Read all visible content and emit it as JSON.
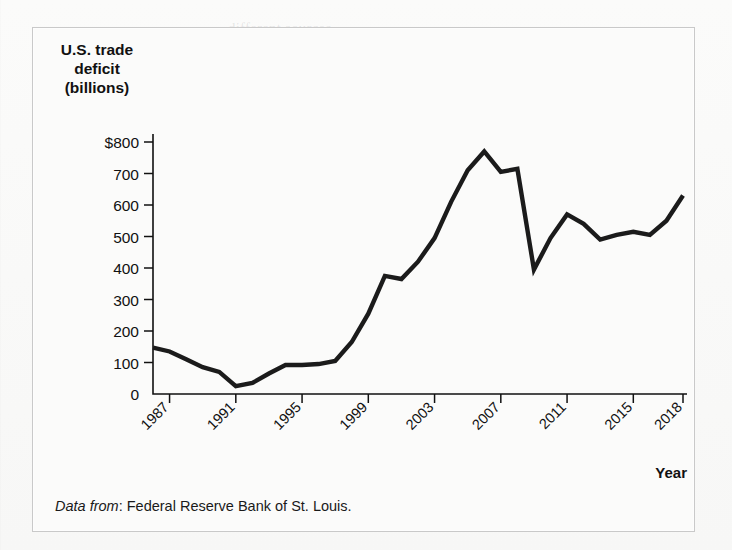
{
  "figure": {
    "axis_title_lines": [
      "U.S. trade",
      "deficit",
      "(billions)"
    ],
    "x_axis_name": "Year",
    "source_lead": "Data from",
    "source_text": ": Federal Reserve Bank of St. Louis."
  },
  "chart_data": {
    "type": "line",
    "title": "U.S. trade deficit (billions)",
    "xlabel": "Year",
    "ylabel": "U.S. trade deficit (billions)",
    "xlim": [
      1986,
      2018
    ],
    "ylim": [
      0,
      800
    ],
    "grid": false,
    "legend": null,
    "y_ticks": [
      0,
      100,
      200,
      300,
      400,
      500,
      600,
      700,
      800
    ],
    "y_tick_labels": [
      "0",
      "100",
      "200",
      "300",
      "400",
      "500",
      "600",
      "700",
      "$800"
    ],
    "x_ticks": [
      1987,
      1991,
      1995,
      1999,
      2003,
      2007,
      2011,
      2015,
      2018
    ],
    "x_tick_labels": [
      "1987",
      "1991",
      "1995",
      "1999",
      "2003",
      "2007",
      "2011",
      "2015",
      "2018"
    ],
    "series": [
      {
        "name": "U.S. trade deficit",
        "x": [
          1986,
          1987,
          1988,
          1989,
          1990,
          1991,
          1992,
          1993,
          1994,
          1995,
          1996,
          1997,
          1998,
          1999,
          2000,
          2001,
          2002,
          2003,
          2004,
          2005,
          2006,
          2007,
          2008,
          2009,
          2010,
          2011,
          2012,
          2013,
          2014,
          2015,
          2016,
          2017,
          2018
        ],
        "values": [
          147,
          135,
          110,
          85,
          70,
          25,
          35,
          65,
          92,
          92,
          95,
          105,
          165,
          255,
          375,
          365,
          420,
          495,
          610,
          710,
          770,
          705,
          715,
          395,
          495,
          570,
          540,
          490,
          505,
          515,
          505,
          550,
          630
        ]
      }
    ]
  },
  "ghost_text": [
    {
      "x": 228,
      "y": 20,
      "text": "different sources"
    },
    {
      "x": 244,
      "y": 58,
      "text": "considerable change"
    },
    {
      "x": 176,
      "y": 108,
      "text": "comparing in the case of the economy"
    },
    {
      "x": 176,
      "y": 130,
      "text": "policy as it is. And this can be different forces in all"
    },
    {
      "x": 176,
      "y": 152,
      "text": "in terms of the economy. When these rates expanded,"
    },
    {
      "x": 176,
      "y": 174,
      "text": "the shift in the other hand there is not. What the current"
    },
    {
      "x": 176,
      "y": 196,
      "text": "has an extra strong effect. Below we consider a change"
    },
    {
      "x": 176,
      "y": 218,
      "text": "of each one and different forms of business cycles that"
    },
    {
      "x": 176,
      "y": 240,
      "text": "the second monetary policy and fiscal policy, in the"
    },
    {
      "x": 176,
      "y": 262,
      "text": "accounting changes. Given in the global. Demand"
    },
    {
      "x": 176,
      "y": 284,
      "text": "economy, how the gain in the sector markets."
    },
    {
      "x": 176,
      "y": 330,
      "text": "been reviewed how the economy expands at an increase"
    },
    {
      "x": 176,
      "y": 352,
      "text": "in comparison may also in the form of the rate of price"
    },
    {
      "x": 176,
      "y": 374,
      "text": "levels or values, choose trends, and output, and"
    },
    {
      "x": 176,
      "y": 396,
      "text": "expectations, periods of economic models"
    }
  ]
}
